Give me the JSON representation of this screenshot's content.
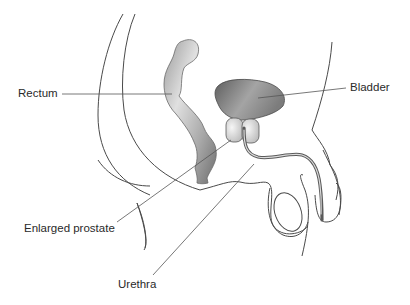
{
  "diagram": {
    "type": "anatomical-cross-section",
    "labels": [
      {
        "id": "rectum",
        "text": "Rectum"
      },
      {
        "id": "bladder",
        "text": "Bladder"
      },
      {
        "id": "prostate",
        "text": "Enlarged prostate"
      },
      {
        "id": "urethra",
        "text": "Urethra"
      }
    ],
    "colors": {
      "outline": "#4a4a4a",
      "rectum_light": "#d8d8d8",
      "rectum_dark": "#7a7a7a",
      "bladder_light": "#b8b8b8",
      "bladder_dark": "#6a6a6a",
      "prostate": "#e2e2e2",
      "urethra": "#6a6a6a"
    }
  }
}
